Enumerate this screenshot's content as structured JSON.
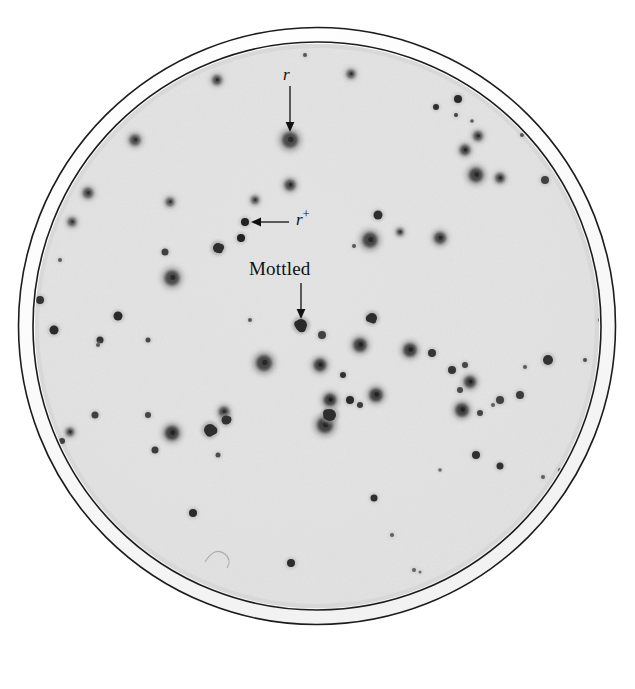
{
  "figure": {
    "kind": "petri-dish-photograph",
    "background_color": "#ffffff",
    "plate": {
      "outer_rim_color": "#ffffff",
      "rim_line_color": "#1a1a1a",
      "agar_color": "#e3e3e3",
      "agar_shadow_color": "#d2d2d2",
      "center_x": 317,
      "center_y": 326,
      "outer_radius": 299,
      "inner_radius": 285,
      "agar_radius": 282
    },
    "annotations": [
      {
        "id": "r",
        "label": "r",
        "style": "italic",
        "arrow": "down",
        "label_x": 283,
        "label_y": 66,
        "arrow_x1": 290,
        "arrow_y1": 86,
        "arrow_x2": 290,
        "arrow_y2": 130,
        "points_to": "large fuzzy plaque"
      },
      {
        "id": "r-plus",
        "label": "r",
        "superscript": "+",
        "style": "italic",
        "arrow": "left",
        "label_x": 296,
        "label_y": 211,
        "arrow_x1": 289,
        "arrow_y1": 222,
        "arrow_x2": 253,
        "arrow_y2": 222,
        "points_to": "small sharp dark dots"
      },
      {
        "id": "mottled",
        "label": "Mottled",
        "style": "roman",
        "arrow": "down",
        "label_x": 249,
        "label_y": 259,
        "arrow_x1": 301,
        "arrow_y1": 283,
        "arrow_x2": 301,
        "arrow_y2": 317,
        "points_to": "mottled plaque"
      }
    ],
    "artifacts": [
      {
        "id": "scratch-arc",
        "description": "faint hairline arc scratch on agar",
        "x": 213,
        "y": 555
      }
    ],
    "plaques": [
      {
        "x": 351,
        "y": 74,
        "r": 5.0,
        "type": "fuzzy",
        "d": 0.7
      },
      {
        "x": 217,
        "y": 80,
        "r": 5.5,
        "type": "fuzzy",
        "d": 0.72
      },
      {
        "x": 458,
        "y": 99,
        "r": 4.0,
        "type": "dot",
        "d": 0.82
      },
      {
        "x": 290,
        "y": 140,
        "r": 9.5,
        "type": "fuzzy",
        "d": 0.72
      },
      {
        "x": 135,
        "y": 140,
        "r": 6.5,
        "type": "fuzzy",
        "d": 0.7
      },
      {
        "x": 436,
        "y": 107,
        "r": 3.0,
        "type": "dot",
        "d": 0.8
      },
      {
        "x": 456,
        "y": 115,
        "r": 2.0,
        "type": "dot",
        "d": 0.72
      },
      {
        "x": 472,
        "y": 121,
        "r": 1.8,
        "type": "dot",
        "d": 0.6
      },
      {
        "x": 477,
        "y": 135,
        "r": 1.5,
        "type": "dot",
        "d": 0.55
      },
      {
        "x": 478,
        "y": 136,
        "r": 5.5,
        "type": "fuzzy",
        "d": 0.72
      },
      {
        "x": 522,
        "y": 135,
        "r": 2.0,
        "type": "dot",
        "d": 0.62
      },
      {
        "x": 465,
        "y": 150,
        "r": 6.0,
        "type": "fuzzy",
        "d": 0.74
      },
      {
        "x": 476,
        "y": 175,
        "r": 8.5,
        "type": "fuzzy",
        "d": 0.74
      },
      {
        "x": 500,
        "y": 178,
        "r": 5.5,
        "type": "fuzzy",
        "d": 0.74
      },
      {
        "x": 545,
        "y": 180,
        "r": 4.0,
        "type": "dot",
        "d": 0.72
      },
      {
        "x": 290,
        "y": 185,
        "r": 6.5,
        "type": "fuzzy",
        "d": 0.72
      },
      {
        "x": 88,
        "y": 193,
        "r": 6.0,
        "type": "fuzzy",
        "d": 0.7
      },
      {
        "x": 170,
        "y": 202,
        "r": 5.0,
        "type": "fuzzy",
        "d": 0.68
      },
      {
        "x": 255,
        "y": 200,
        "r": 4.5,
        "type": "fuzzy",
        "d": 0.7
      },
      {
        "x": 72,
        "y": 222,
        "r": 5.0,
        "type": "fuzzy",
        "d": 0.68
      },
      {
        "x": 245,
        "y": 222,
        "r": 4.0,
        "type": "dot",
        "d": 0.86
      },
      {
        "x": 241,
        "y": 238,
        "r": 4.0,
        "type": "dot",
        "d": 0.86
      },
      {
        "x": 218,
        "y": 248,
        "r": 5.0,
        "type": "mottled",
        "d": 0.8
      },
      {
        "x": 378,
        "y": 215,
        "r": 4.5,
        "type": "dot",
        "d": 0.8
      },
      {
        "x": 400,
        "y": 232,
        "r": 4.0,
        "type": "fuzzy",
        "d": 0.74
      },
      {
        "x": 370,
        "y": 240,
        "r": 9.0,
        "type": "fuzzy",
        "d": 0.74
      },
      {
        "x": 440,
        "y": 238,
        "r": 7.0,
        "type": "fuzzy",
        "d": 0.74
      },
      {
        "x": 354,
        "y": 246,
        "r": 2.0,
        "type": "dot",
        "d": 0.62
      },
      {
        "x": 165,
        "y": 252,
        "r": 3.5,
        "type": "dot",
        "d": 0.72
      },
      {
        "x": 172,
        "y": 278,
        "r": 9.0,
        "type": "fuzzy",
        "d": 0.72
      },
      {
        "x": 118,
        "y": 316,
        "r": 4.5,
        "type": "dot",
        "d": 0.82
      },
      {
        "x": 54,
        "y": 330,
        "r": 4.5,
        "type": "dot",
        "d": 0.82
      },
      {
        "x": 100,
        "y": 340,
        "r": 3.5,
        "type": "dot",
        "d": 0.78
      },
      {
        "x": 98,
        "y": 345,
        "r": 2.0,
        "type": "dot",
        "d": 0.6
      },
      {
        "x": 148,
        "y": 340,
        "r": 2.5,
        "type": "dot",
        "d": 0.68
      },
      {
        "x": 301,
        "y": 325,
        "r": 6.0,
        "type": "mottled",
        "d": 0.82
      },
      {
        "x": 360,
        "y": 345,
        "r": 8.0,
        "type": "fuzzy",
        "d": 0.76
      },
      {
        "x": 322,
        "y": 335,
        "r": 4.0,
        "type": "dot",
        "d": 0.72
      },
      {
        "x": 264,
        "y": 363,
        "r": 9.5,
        "type": "fuzzy",
        "d": 0.74
      },
      {
        "x": 372,
        "y": 318,
        "r": 5.0,
        "type": "mottled",
        "d": 0.8
      },
      {
        "x": 410,
        "y": 350,
        "r": 8.0,
        "type": "fuzzy",
        "d": 0.76
      },
      {
        "x": 343,
        "y": 375,
        "r": 3.0,
        "type": "dot",
        "d": 0.78
      },
      {
        "x": 330,
        "y": 400,
        "r": 7.5,
        "type": "fuzzy",
        "d": 0.78
      },
      {
        "x": 350,
        "y": 400,
        "r": 4.0,
        "type": "dot",
        "d": 0.82
      },
      {
        "x": 360,
        "y": 405,
        "r": 3.0,
        "type": "dot",
        "d": 0.74
      },
      {
        "x": 376,
        "y": 395,
        "r": 8.0,
        "type": "fuzzy",
        "d": 0.76
      },
      {
        "x": 325,
        "y": 425,
        "r": 9.5,
        "type": "fuzzy",
        "d": 0.76
      },
      {
        "x": 330,
        "y": 415,
        "r": 6.0,
        "type": "mottled",
        "d": 0.8
      },
      {
        "x": 432,
        "y": 353,
        "r": 4.0,
        "type": "dot",
        "d": 0.76
      },
      {
        "x": 320,
        "y": 365,
        "r": 7.5,
        "type": "fuzzy",
        "d": 0.76
      },
      {
        "x": 452,
        "y": 370,
        "r": 4.0,
        "type": "dot",
        "d": 0.76
      },
      {
        "x": 465,
        "y": 365,
        "r": 3.0,
        "type": "dot",
        "d": 0.7
      },
      {
        "x": 470,
        "y": 382,
        "r": 7.0,
        "type": "fuzzy",
        "d": 0.76
      },
      {
        "x": 460,
        "y": 390,
        "r": 3.0,
        "type": "dot",
        "d": 0.68
      },
      {
        "x": 462,
        "y": 410,
        "r": 8.0,
        "type": "fuzzy",
        "d": 0.76
      },
      {
        "x": 500,
        "y": 400,
        "r": 4.0,
        "type": "dot",
        "d": 0.72
      },
      {
        "x": 493,
        "y": 405,
        "r": 2.0,
        "type": "dot",
        "d": 0.58
      },
      {
        "x": 548,
        "y": 360,
        "r": 5.0,
        "type": "dot",
        "d": 0.78
      },
      {
        "x": 585,
        "y": 360,
        "r": 2.0,
        "type": "dot",
        "d": 0.66
      },
      {
        "x": 520,
        "y": 395,
        "r": 4.0,
        "type": "dot",
        "d": 0.74
      },
      {
        "x": 525,
        "y": 367,
        "r": 2.0,
        "type": "dot",
        "d": 0.6
      },
      {
        "x": 480,
        "y": 413,
        "r": 3.0,
        "type": "dot",
        "d": 0.7
      },
      {
        "x": 476,
        "y": 455,
        "r": 4.0,
        "type": "dot",
        "d": 0.8
      },
      {
        "x": 500,
        "y": 466,
        "r": 3.5,
        "type": "dot",
        "d": 0.78
      },
      {
        "x": 543,
        "y": 477,
        "r": 2.0,
        "type": "dot",
        "d": 0.58
      },
      {
        "x": 374,
        "y": 498,
        "r": 3.5,
        "type": "dot",
        "d": 0.8
      },
      {
        "x": 392,
        "y": 535,
        "r": 2.0,
        "type": "dot",
        "d": 0.58
      },
      {
        "x": 193,
        "y": 513,
        "r": 4.0,
        "type": "dot",
        "d": 0.82
      },
      {
        "x": 291,
        "y": 563,
        "r": 4.0,
        "type": "dot",
        "d": 0.8
      },
      {
        "x": 172,
        "y": 433,
        "r": 8.5,
        "type": "fuzzy",
        "d": 0.76
      },
      {
        "x": 155,
        "y": 450,
        "r": 3.5,
        "type": "dot",
        "d": 0.74
      },
      {
        "x": 210,
        "y": 430,
        "r": 6.0,
        "type": "mottled",
        "d": 0.8
      },
      {
        "x": 218,
        "y": 455,
        "r": 2.5,
        "type": "dot",
        "d": 0.66
      },
      {
        "x": 148,
        "y": 415,
        "r": 3.0,
        "type": "dot",
        "d": 0.7
      },
      {
        "x": 95,
        "y": 415,
        "r": 3.5,
        "type": "dot",
        "d": 0.72
      },
      {
        "x": 70,
        "y": 432,
        "r": 4.5,
        "type": "fuzzy",
        "d": 0.74
      },
      {
        "x": 62,
        "y": 441,
        "r": 3.0,
        "type": "dot",
        "d": 0.72
      },
      {
        "x": 224,
        "y": 412,
        "r": 6.0,
        "type": "fuzzy",
        "d": 0.74
      },
      {
        "x": 226,
        "y": 420,
        "r": 4.5,
        "type": "mottled",
        "d": 0.78
      },
      {
        "x": 414,
        "y": 570,
        "r": 2.0,
        "type": "dot",
        "d": 0.56
      },
      {
        "x": 420,
        "y": 572,
        "r": 1.5,
        "type": "dot",
        "d": 0.52
      },
      {
        "x": 560,
        "y": 470,
        "r": 2.0,
        "type": "dot",
        "d": 0.56
      },
      {
        "x": 250,
        "y": 320,
        "r": 2.0,
        "type": "dot",
        "d": 0.6
      },
      {
        "x": 440,
        "y": 470,
        "r": 1.8,
        "type": "dot",
        "d": 0.52
      },
      {
        "x": 305,
        "y": 55,
        "r": 2.0,
        "type": "dot",
        "d": 0.62
      },
      {
        "x": 600,
        "y": 320,
        "r": 2.0,
        "type": "dot",
        "d": 0.58
      },
      {
        "x": 40,
        "y": 300,
        "r": 4.0,
        "type": "dot",
        "d": 0.78
      },
      {
        "x": 60,
        "y": 260,
        "r": 2.0,
        "type": "dot",
        "d": 0.58
      }
    ]
  }
}
